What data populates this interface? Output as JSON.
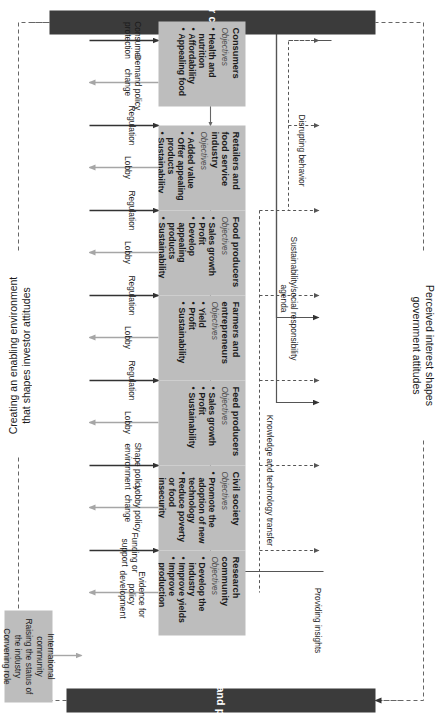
{
  "diagram": {
    "title_top": "Perceived interest shapes government attitudes",
    "title_bottom": "Creating an enabling environment that shapes investor attitudes",
    "title_top_line1": "Perceived interest shapes",
    "title_top_line2": "government attitudes",
    "title_bottom_line1": "Creating an enabling environment",
    "title_bottom_line2": "that shapes investor attitudes"
  },
  "pillars": {
    "left": "Investor community",
    "right": "Government and policy makers"
  },
  "note_box": {
    "line1": "International community",
    "line2": "Raising the status of the industry",
    "line3": "Convening role"
  },
  "objectives_label": "Objectives",
  "actors": [
    {
      "id": "consumers",
      "title": "Consumers",
      "objectives_label": "Objectives",
      "objectives": [
        "Health and nutrition",
        "Affordability",
        "Appealing food"
      ],
      "gov_to_actor": "Consumer protection",
      "actor_to_gov": "Demand policy change"
    },
    {
      "id": "retailers",
      "title": "Retailers and food service industry",
      "objectives_label": "Objectives",
      "objectives": [
        "Added value",
        "Offer appealing products",
        "Sustainability"
      ],
      "gov_to_actor": "Regulation",
      "actor_to_gov": "Lobby"
    },
    {
      "id": "food-producers",
      "title": "Food producers",
      "objectives_label": "Objectives",
      "objectives": [
        "Sales growth",
        "Profit",
        "Develop appealing products",
        "Sustainability"
      ],
      "gov_to_actor": "Regulation",
      "actor_to_gov": "Lobby"
    },
    {
      "id": "farmers",
      "title": "Farmers and entrepreneurs",
      "objectives_label": "Objectives",
      "objectives": [
        "Yield",
        "Profit",
        "Sustainability"
      ],
      "gov_to_actor": "Regulation",
      "actor_to_gov": "Lobby"
    },
    {
      "id": "feed-producers",
      "title": "Feed producers",
      "objectives_label": "Objectives",
      "objectives": [
        "Sales growth",
        "Profit",
        "Sustainability"
      ],
      "gov_to_actor": "Regulation",
      "actor_to_gov": "Lobby"
    },
    {
      "id": "civil-society",
      "title": "Civil society",
      "objectives_label": "Objectives",
      "objectives": [
        "Promote the adoption of new technology",
        "Reduce poverty or food insecurity"
      ],
      "gov_to_actor": "Shape policy environment",
      "actor_to_gov": "Lobby policy change"
    },
    {
      "id": "research-community",
      "title": "Research community",
      "objectives_label": "Objectives",
      "objectives": [
        "Develop the industry",
        "Improve yields",
        "Improve production systems"
      ],
      "gov_to_actor": "Funding or support",
      "actor_to_gov": "Evidence for policy development"
    }
  ],
  "investor_labels": {
    "disrupting": "Disrupting behavior",
    "sustainability": "Sustainability/social responsibility agenda",
    "knowledge": "Knowledge and technology transfer",
    "insights": "Providing insights"
  },
  "colors": {
    "pillar": "#3b3b3b",
    "box": "#bdbdbd",
    "arrow_dark": "#333333",
    "arrow_light": "#a6a6a6",
    "background": "#ffffff"
  }
}
